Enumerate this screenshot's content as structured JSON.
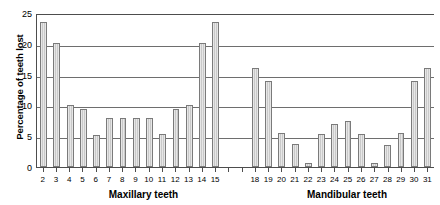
{
  "chart_data": {
    "type": "bar",
    "title": "",
    "xlabel": "",
    "ylabel": "Percentage of teeth lost",
    "ylim": [
      0,
      25
    ],
    "yticks": [
      0,
      5,
      10,
      15,
      20,
      25
    ],
    "grid": true,
    "legend": false,
    "legend_position": "none",
    "groups": [
      {
        "name": "maxillary",
        "label": "Maxillary teeth"
      },
      {
        "name": "mandibular",
        "label": "Mandibular teeth"
      }
    ],
    "categories": [
      "2",
      "3",
      "4",
      "5",
      "6",
      "7",
      "8",
      "9",
      "10",
      "11",
      "12",
      "13",
      "14",
      "15",
      "",
      "",
      "18",
      "19",
      "20",
      "21",
      "22",
      "23",
      "24",
      "25",
      "26",
      "27",
      "28",
      "29",
      "30",
      "31"
    ],
    "values": [
      23.5,
      20.2,
      10.0,
      9.4,
      5.2,
      8.0,
      8.0,
      8.0,
      8.0,
      5.3,
      9.4,
      10.0,
      20.2,
      23.5,
      null,
      null,
      16.0,
      14.0,
      5.6,
      3.8,
      0.7,
      5.3,
      7.0,
      7.4,
      5.4,
      0.7,
      3.6,
      5.6,
      14.0,
      16.0
    ]
  },
  "style": {
    "bar_fill": "#c9c9c9",
    "bar_stroke": "#7a7a7a",
    "axis_color": "#4d4d4d",
    "grid_color": "#6e6e6e",
    "background": "#ffffff",
    "text_color": "#000000"
  }
}
